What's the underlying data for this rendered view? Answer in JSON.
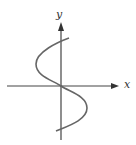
{
  "diagram": {
    "type": "graph",
    "axes": {
      "x_label": "x",
      "y_label": "y"
    },
    "colors": {
      "axis": "#444444",
      "curve": "#666666"
    }
  }
}
